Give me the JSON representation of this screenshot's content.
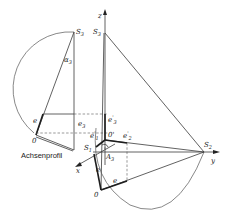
{
  "diagram": {
    "caption": "Achsenprofil",
    "labels": {
      "z_axis": "z",
      "y_axis": "y",
      "x_axis": "x",
      "S3_left": "S",
      "S3_left_sub": "3",
      "S3_right": "S",
      "S3_right_sub": "3",
      "S2": "S",
      "S2_sub": "2",
      "S1": "S",
      "S1_sub": "1",
      "alpha3": "α",
      "alpha3_sub": "3",
      "e_left": "e",
      "e3_left": "e",
      "e3_left_sub": "3",
      "O_left": "0",
      "O_prime": "0'",
      "e3_prime": "e",
      "e3_prime_sup": "'",
      "e3_prime_sub": "3",
      "e1_prime": "e",
      "e1_prime_sup": "'",
      "e1_prime_sub": "1",
      "e2_prime": "e",
      "e2_prime_sup": "'",
      "e2_prime_sub": "2",
      "A3": "A",
      "A3_sub": "3",
      "e_lower_left": "e",
      "e_lower_right": "e",
      "O_bottom": "0"
    },
    "colors": {
      "line": "#3a3a3a",
      "background": "#ffffff"
    }
  }
}
